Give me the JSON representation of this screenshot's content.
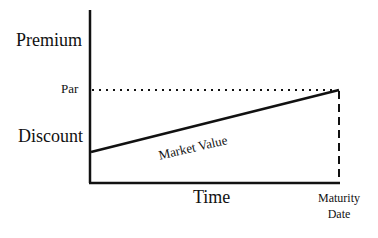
{
  "diagram": {
    "y_labels": {
      "premium": "Premium",
      "par": "Par",
      "discount": "Discount"
    },
    "x_labels": {
      "time": "Time",
      "maturity_line1": "Maturity",
      "maturity_line2": "Date"
    },
    "line_label": "Market Value",
    "elements": [
      {
        "type": "axis",
        "orientation": "vertical"
      },
      {
        "type": "axis",
        "orientation": "horizontal"
      },
      {
        "type": "dotted-line",
        "meaning": "Par level"
      },
      {
        "type": "solid-line",
        "meaning": "Market Value rising from discount to par at maturity"
      },
      {
        "type": "dashed-line",
        "meaning": "Maturity Date marker"
      }
    ]
  }
}
